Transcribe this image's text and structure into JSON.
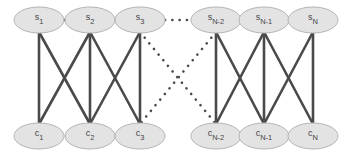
{
  "diagram": {
    "colors": {
      "edge": "#4a4a4a",
      "node_fill": "#e3e3e3",
      "node_stroke": "#b4b4b4",
      "label": "#444444"
    },
    "top_row": [
      {
        "id": "s1",
        "base": "s",
        "sub": "1"
      },
      {
        "id": "s2",
        "base": "s",
        "sub": "2"
      },
      {
        "id": "s3",
        "base": "s",
        "sub": "3"
      },
      {
        "id": "sN-2",
        "base": "s",
        "sub": "N-2"
      },
      {
        "id": "sN-1",
        "base": "s",
        "sub": "N-1"
      },
      {
        "id": "sN",
        "base": "s",
        "sub": "N"
      }
    ],
    "bottom_row": [
      {
        "id": "c1",
        "base": "c",
        "sub": "1"
      },
      {
        "id": "c2",
        "base": "c",
        "sub": "2"
      },
      {
        "id": "c3",
        "base": "c",
        "sub": "3"
      },
      {
        "id": "cN-2",
        "base": "c",
        "sub": "N-2"
      },
      {
        "id": "cN-1",
        "base": "c",
        "sub": "N-1"
      },
      {
        "id": "cN",
        "base": "c",
        "sub": "N"
      }
    ],
    "edges": [
      {
        "from": "s1",
        "to": "s2",
        "style": "solid"
      },
      {
        "from": "s2",
        "to": "s3",
        "style": "solid"
      },
      {
        "from": "s3",
        "to": "sN-2",
        "style": "dotted"
      },
      {
        "from": "sN-2",
        "to": "sN-1",
        "style": "solid"
      },
      {
        "from": "sN-1",
        "to": "sN",
        "style": "solid"
      },
      {
        "from": "s1",
        "to": "c1",
        "style": "solid"
      },
      {
        "from": "s1",
        "to": "c2",
        "style": "solid"
      },
      {
        "from": "s2",
        "to": "c1",
        "style": "solid"
      },
      {
        "from": "s2",
        "to": "c2",
        "style": "solid"
      },
      {
        "from": "s2",
        "to": "c3",
        "style": "solid"
      },
      {
        "from": "s3",
        "to": "c2",
        "style": "solid"
      },
      {
        "from": "s3",
        "to": "c3",
        "style": "solid"
      },
      {
        "from": "s3",
        "to": "cN-2",
        "style": "dotted"
      },
      {
        "from": "sN-2",
        "to": "c3",
        "style": "dotted"
      },
      {
        "from": "sN-2",
        "to": "cN-2",
        "style": "solid"
      },
      {
        "from": "sN-2",
        "to": "cN-1",
        "style": "solid"
      },
      {
        "from": "sN-1",
        "to": "cN-2",
        "style": "solid"
      },
      {
        "from": "sN-1",
        "to": "cN-1",
        "style": "solid"
      },
      {
        "from": "sN-1",
        "to": "cN",
        "style": "solid"
      },
      {
        "from": "sN",
        "to": "cN-1",
        "style": "solid"
      },
      {
        "from": "sN",
        "to": "cN",
        "style": "solid"
      }
    ]
  }
}
